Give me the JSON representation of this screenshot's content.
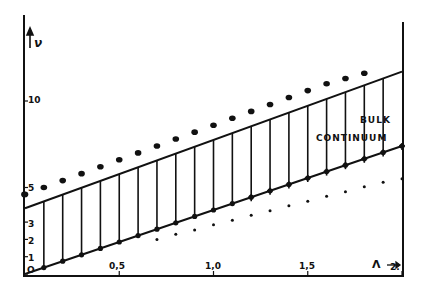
{
  "chart_data": {
    "type": "line",
    "title": "",
    "xlabel": "Λ",
    "ylabel": "ν",
    "xlim": [
      0,
      2
    ],
    "ylim": [
      0,
      12.5
    ],
    "grid": false,
    "x_ticks": [
      "0,5",
      "1,0",
      "1,5",
      "2."
    ],
    "x_tick_values": [
      0.5,
      1.0,
      1.5,
      2.0
    ],
    "y_ticks": [
      "0",
      "1",
      "2",
      "3",
      "5",
      "10"
    ],
    "y_tick_values": [
      0,
      1,
      2,
      3,
      5,
      10
    ],
    "annotations": [
      "BULK",
      "CONTINUUM"
    ],
    "series": [
      {
        "name": "upper continuum boundary",
        "style": "solid line",
        "x": [
          0,
          2
        ],
        "values": [
          3.8,
          11.7
        ]
      },
      {
        "name": "lower continuum boundary",
        "style": "solid line",
        "x": [
          0,
          2
        ],
        "values": [
          0.0,
          7.4
        ]
      },
      {
        "name": "upper discrete levels",
        "style": "large dots",
        "x": [
          0.0,
          0.1,
          0.2,
          0.3,
          0.4,
          0.5,
          0.6,
          0.7,
          0.8,
          0.9,
          1.0,
          1.1,
          1.2,
          1.3,
          1.4,
          1.5,
          1.6,
          1.7,
          1.8
        ],
        "values": [
          4.6,
          5.0,
          5.4,
          5.8,
          6.2,
          6.6,
          7.0,
          7.4,
          7.8,
          8.2,
          8.6,
          9.0,
          9.4,
          9.8,
          10.2,
          10.6,
          11.0,
          11.3,
          11.6
        ]
      },
      {
        "name": "lower-boundary points",
        "style": "dots/crosses on lower line",
        "x": [
          0.1,
          0.2,
          0.3,
          0.4,
          0.5,
          0.6,
          0.7,
          0.8,
          0.9,
          1.0,
          1.1,
          1.2,
          1.3,
          1.4,
          1.5,
          1.6,
          1.7,
          1.8,
          1.9,
          2.0
        ],
        "values": [
          0.37,
          0.74,
          1.11,
          1.48,
          1.85,
          2.22,
          2.59,
          2.96,
          3.33,
          3.7,
          4.07,
          4.44,
          4.81,
          5.18,
          5.55,
          5.92,
          6.29,
          6.66,
          7.03,
          7.4
        ]
      },
      {
        "name": "lower discrete levels (below continuum)",
        "style": "small dots",
        "x": [
          0.7,
          0.8,
          0.9,
          1.0,
          1.1,
          1.2,
          1.3,
          1.4,
          1.5,
          1.6,
          1.7,
          1.8,
          1.9,
          2.0
        ],
        "values": [
          2.0,
          2.3,
          2.55,
          2.85,
          3.1,
          3.4,
          3.65,
          3.95,
          4.2,
          4.5,
          4.75,
          5.05,
          5.3,
          5.5
        ]
      }
    ],
    "hatching": {
      "description": "vertical lines between lower and upper boundaries (continuum region)",
      "x": [
        0.1,
        0.2,
        0.3,
        0.4,
        0.5,
        0.6,
        0.7,
        0.8,
        0.9,
        1.0,
        1.1,
        1.2,
        1.3,
        1.4,
        1.5,
        1.6,
        1.7,
        1.8,
        1.9
      ]
    }
  },
  "labels": {
    "y_axis": "ν",
    "x_axis": "Λ",
    "bulk": "BULK",
    "continuum": "CONTINUUM",
    "tick_x_05": "0,5",
    "tick_x_10": "1,0",
    "tick_x_15": "1,5",
    "tick_x_2": "2.",
    "tick_y_0": "O",
    "tick_y_1": "1",
    "tick_y_2": "2",
    "tick_y_3": "3",
    "tick_y_5": "5",
    "tick_y_10": "10"
  }
}
